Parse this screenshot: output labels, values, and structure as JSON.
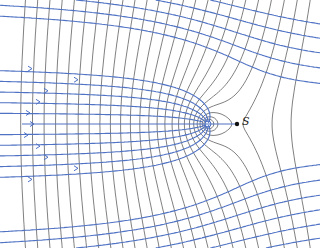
{
  "figure": {
    "type": "flow-net",
    "stagnation_label": "S",
    "colors": {
      "streamline": "#4f72c4",
      "equipotential": "#555555",
      "point": "#111111",
      "background": "#ffffff"
    },
    "source": {
      "x": 208,
      "y": 124
    },
    "stagnation_point": {
      "x": 237,
      "y": 124
    },
    "streamline_count": 11,
    "equipotential_style": "dashed"
  }
}
